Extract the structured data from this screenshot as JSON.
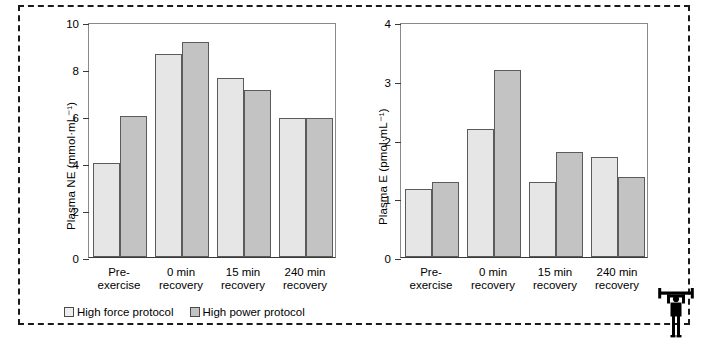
{
  "figure": {
    "border_style": "dashed",
    "background": "#ffffff",
    "icon": "weightlifter-icon"
  },
  "legend": {
    "position": "bottom-left",
    "items": [
      {
        "label": "High force protocol",
        "color": "#e6e6e6",
        "key": "force"
      },
      {
        "label": "High power protocol",
        "color": "#c3c3c3",
        "key": "power"
      }
    ]
  },
  "categories": [
    {
      "line1": "Pre-",
      "line2": "exercise"
    },
    {
      "line1": "0 min",
      "line2": "recovery"
    },
    {
      "line1": "15 min",
      "line2": "recovery"
    },
    {
      "line1": "240 min",
      "line2": "recovery"
    }
  ],
  "chart_data": [
    {
      "id": "plasma-ne",
      "type": "bar",
      "title": "",
      "xlabel": "",
      "ylabel": "Plasma NE (mmol·mL⁻¹)",
      "categories": [
        "Pre-exercise",
        "0 min recovery",
        "15 min recovery",
        "240 min recovery"
      ],
      "series": [
        {
          "name": "High force protocol",
          "values": [
            4.0,
            8.65,
            7.6,
            5.9
          ],
          "color": "#e6e6e6"
        },
        {
          "name": "High power protocol",
          "values": [
            6.0,
            9.15,
            7.1,
            5.9
          ],
          "color": "#c3c3c3"
        }
      ],
      "ylim": [
        0,
        10
      ],
      "yticks": [
        0,
        2,
        4,
        6,
        8,
        10
      ],
      "ytick_labels": [
        "0",
        "2",
        "4",
        "6",
        "8",
        "10"
      ],
      "grid": false,
      "legend_position": "below-axes"
    },
    {
      "id": "plasma-e",
      "type": "bar",
      "title": "",
      "xlabel": "",
      "ylabel": "Plasma E (pmol·mL⁻¹)",
      "categories": [
        "Pre-exercise",
        "0 min recovery",
        "15 min recovery",
        "240 min recovery"
      ],
      "series": [
        {
          "name": "High force protocol",
          "values": [
            1.15,
            2.18,
            1.27,
            1.7
          ],
          "color": "#e6e6e6"
        },
        {
          "name": "High power protocol",
          "values": [
            1.28,
            3.18,
            1.79,
            1.36
          ],
          "color": "#c3c3c3"
        }
      ],
      "ylim": [
        0,
        4
      ],
      "yticks": [
        0,
        1,
        2,
        3,
        4
      ],
      "ytick_labels": [
        "0",
        "1",
        "2",
        "3",
        "4"
      ],
      "grid": false,
      "legend_position": "none"
    }
  ]
}
